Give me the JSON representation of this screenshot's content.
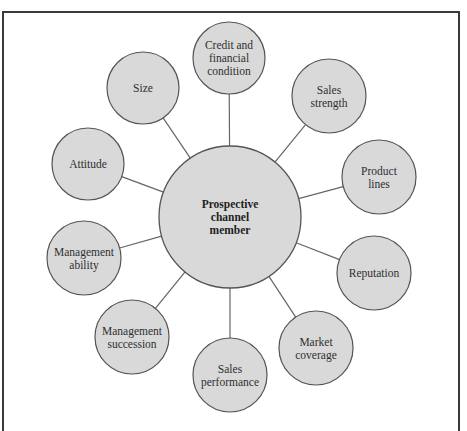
{
  "diagram": {
    "colors": {
      "node_fill": "#d9d9d9",
      "node_stroke": "#555555",
      "connector": "#666666",
      "frame": "#3a3a3a",
      "text": "#2f2f2f"
    },
    "hub": {
      "label_lines": [
        "Prospective",
        "channel",
        "member"
      ],
      "cx": 230,
      "cy": 217,
      "r": 71
    },
    "nodes": [
      {
        "id": "credit",
        "label_lines": [
          "Credit and",
          "financial",
          "condition"
        ],
        "cx": 229,
        "cy": 58,
        "r": 36
      },
      {
        "id": "sales-strength",
        "label_lines": [
          "Sales",
          "strength"
        ],
        "cx": 329,
        "cy": 96,
        "r": 37
      },
      {
        "id": "product-lines",
        "label_lines": [
          "Product",
          "lines"
        ],
        "cx": 379,
        "cy": 177,
        "r": 37
      },
      {
        "id": "reputation",
        "label_lines": [
          "Reputation"
        ],
        "cx": 374,
        "cy": 273,
        "r": 37
      },
      {
        "id": "market-coverage",
        "label_lines": [
          "Market",
          "coverage"
        ],
        "cx": 316,
        "cy": 348,
        "r": 37
      },
      {
        "id": "sales-performance",
        "label_lines": [
          "Sales",
          "performance"
        ],
        "cx": 230,
        "cy": 375,
        "r": 37
      },
      {
        "id": "management-succession",
        "label_lines": [
          "Management",
          "succession"
        ],
        "cx": 132,
        "cy": 337,
        "r": 37
      },
      {
        "id": "management-ability",
        "label_lines": [
          "Management",
          "ability"
        ],
        "cx": 84,
        "cy": 258,
        "r": 37
      },
      {
        "id": "attitude",
        "label_lines": [
          "Attitude"
        ],
        "cx": 88,
        "cy": 164,
        "r": 36
      },
      {
        "id": "size",
        "label_lines": [
          "Size"
        ],
        "cx": 143,
        "cy": 88,
        "r": 36
      }
    ]
  }
}
